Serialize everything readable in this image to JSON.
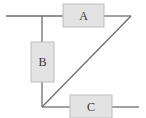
{
  "diagram": {
    "type": "circuit-block-diagram",
    "colors": {
      "wire": "#6e6e6e",
      "box_fill": "#e3e3e3",
      "box_stroke": "#bdbdbd",
      "label": "#333333"
    },
    "components": [
      {
        "id": "A",
        "label": "A"
      },
      {
        "id": "B",
        "label": "B"
      },
      {
        "id": "C",
        "label": "C"
      }
    ]
  }
}
